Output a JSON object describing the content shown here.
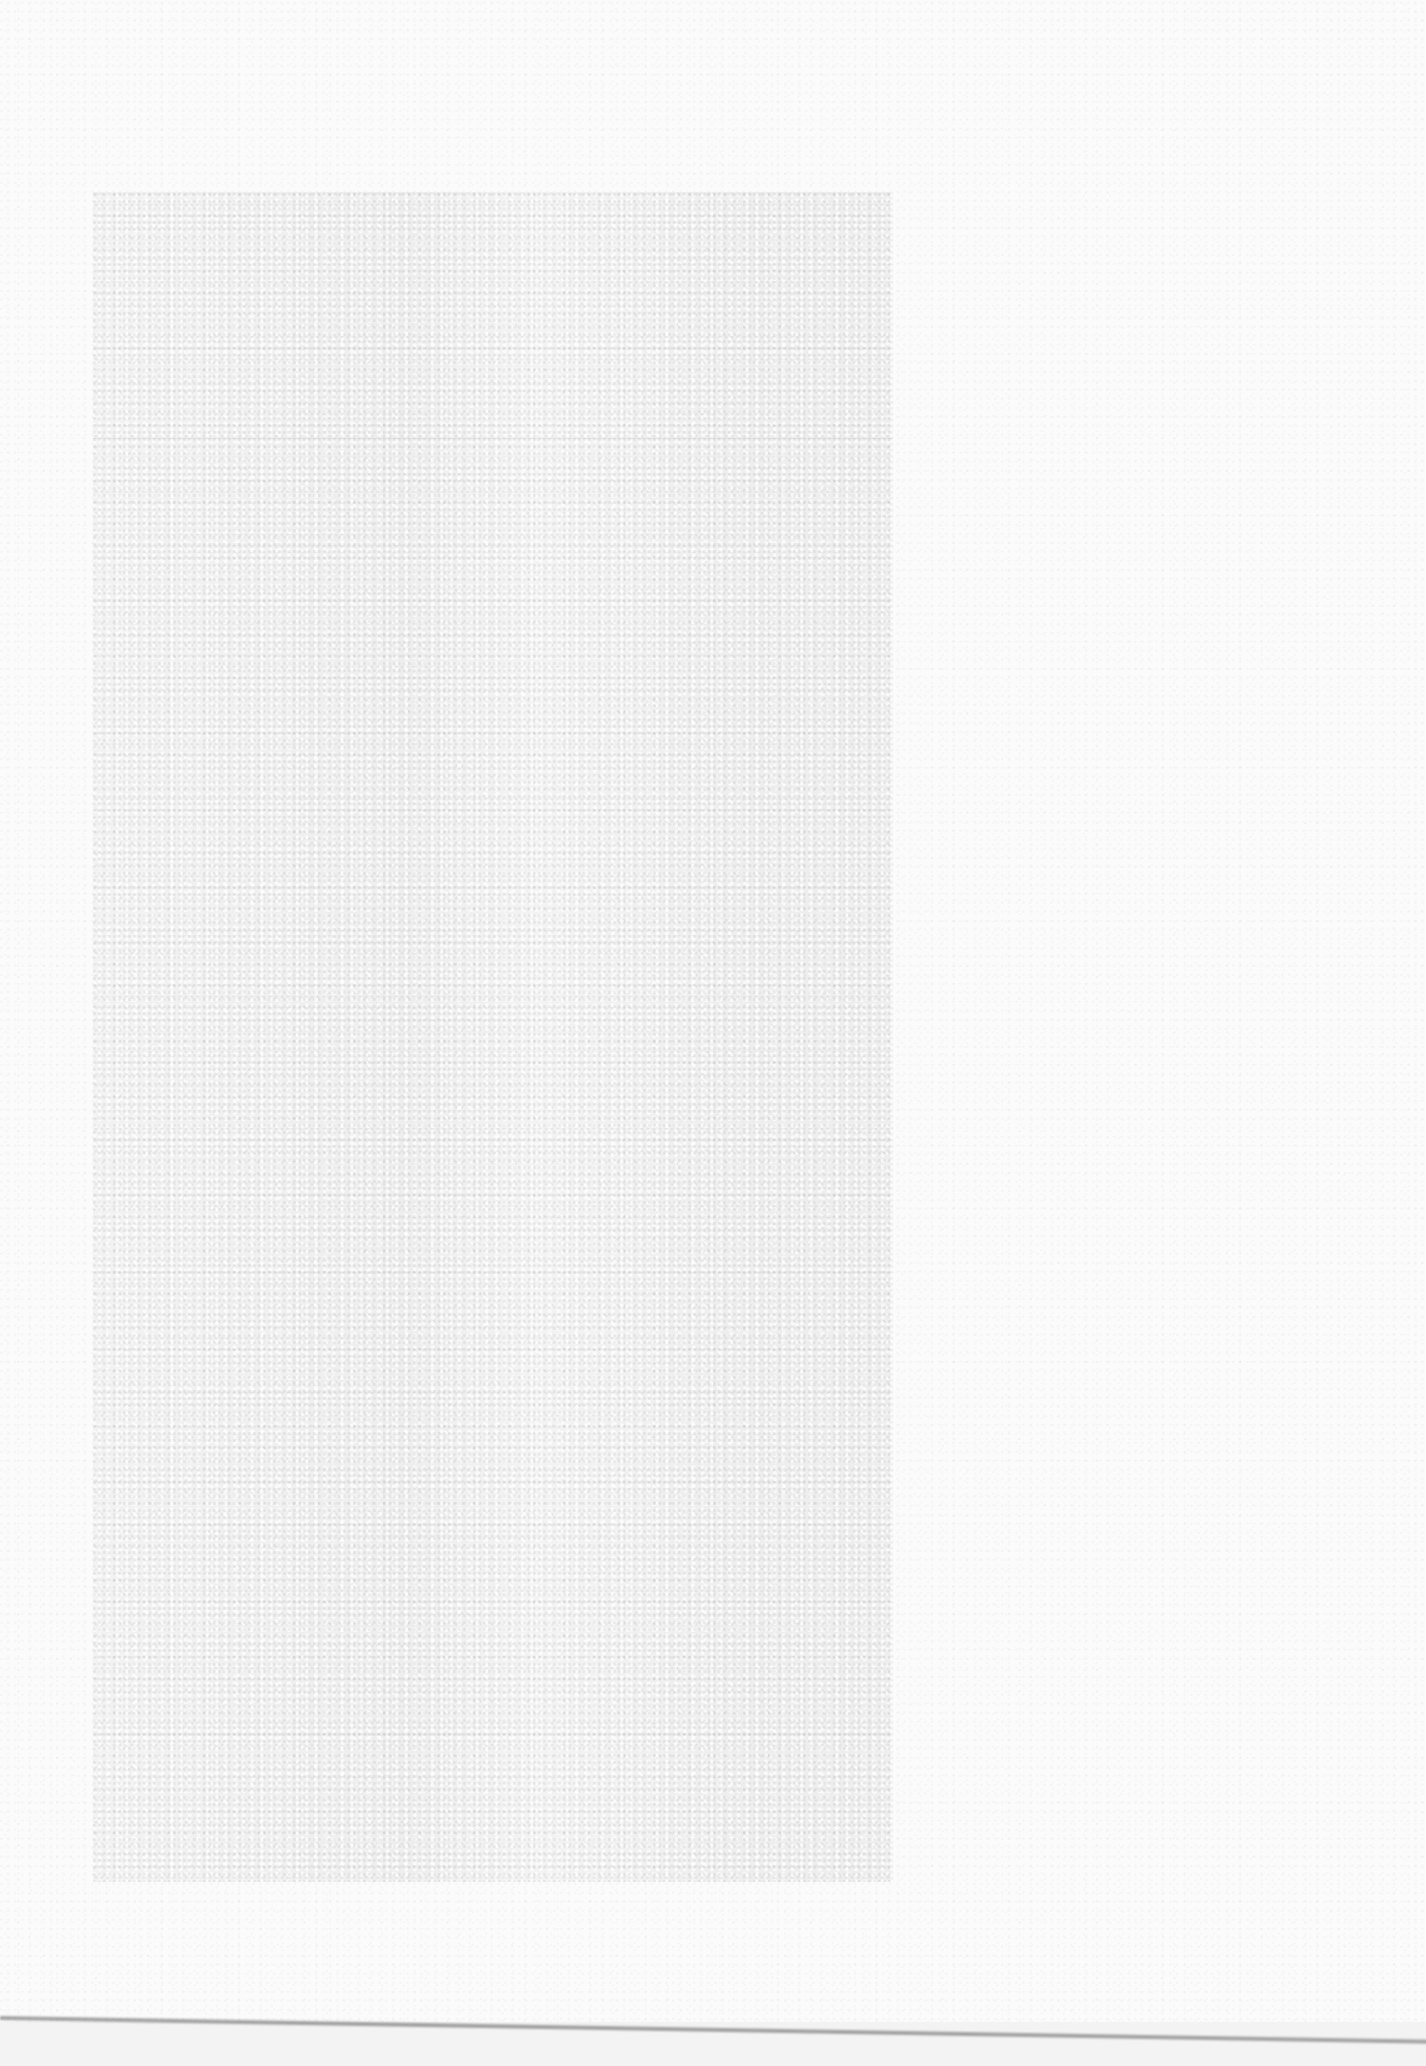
{
  "page": {
    "type": "blank-scanned-page",
    "background_color": "#fbfbfb",
    "text_content": []
  },
  "shaded_panel": {
    "fill_color": "#eeeeee",
    "bounds": {
      "x": 93,
      "y": 192,
      "width": 800,
      "height": 1690
    },
    "text_content": []
  },
  "faint_rule": {
    "y": 438,
    "color": "#e8e8e8"
  },
  "bottom_edge": {
    "color": "#6e6e6e",
    "y_left": 2018,
    "y_right": 2040
  }
}
